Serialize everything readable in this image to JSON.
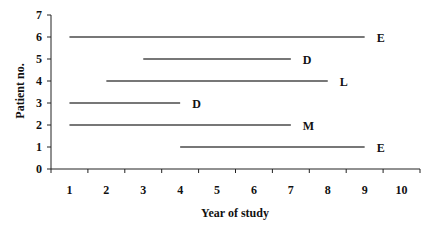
{
  "chart_data": {
    "type": "gantt-line",
    "title": "",
    "xlabel": "Year of study",
    "ylabel": "Patient no.",
    "x_ticks": [
      "1",
      "2",
      "3",
      "4",
      "5",
      "6",
      "7",
      "8",
      "9",
      "10"
    ],
    "y_ticks": [
      "0",
      "1",
      "2",
      "3",
      "4",
      "5",
      "6",
      "7"
    ],
    "xlim": [
      1,
      10
    ],
    "ylim": [
      0,
      7
    ],
    "grid": false,
    "legend": null,
    "series": [
      {
        "patient": 6,
        "start_year": 1,
        "end_year": 9,
        "label": "E"
      },
      {
        "patient": 5,
        "start_year": 3,
        "end_year": 7,
        "label": "D"
      },
      {
        "patient": 4,
        "start_year": 2,
        "end_year": 8,
        "label": "L"
      },
      {
        "patient": 3,
        "start_year": 1,
        "end_year": 4,
        "label": "D"
      },
      {
        "patient": 2,
        "start_year": 1,
        "end_year": 7,
        "label": "M"
      },
      {
        "patient": 1,
        "start_year": 4,
        "end_year": 9,
        "label": "E"
      }
    ],
    "colors": {
      "line": "#4a4a4a",
      "axis": "#222222",
      "text": "#111111"
    }
  }
}
